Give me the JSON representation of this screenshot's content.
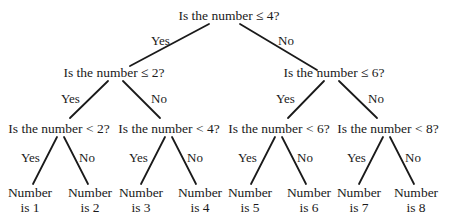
{
  "diagram": {
    "type": "binary-decision-tree",
    "line_color": "#1a1a1a",
    "root": {
      "question": "Is the number ≤ 4?",
      "yes": {
        "question": "Is the number ≤ 2?",
        "yes": {
          "question": "Is the number < 2?",
          "yes": {
            "line1": "Number",
            "line2": "is 1"
          },
          "no": {
            "line1": "Number",
            "line2": "is 2"
          }
        },
        "no": {
          "question": "Is the number < 4?",
          "yes": {
            "line1": "Number",
            "line2": "is 3"
          },
          "no": {
            "line1": "Number",
            "line2": "is 4"
          }
        }
      },
      "no": {
        "question": "Is the number ≤ 6?",
        "yes": {
          "question": "Is the number < 6?",
          "yes": {
            "line1": "Number",
            "line2": "is 5"
          },
          "no": {
            "line1": "Number",
            "line2": "is 6"
          }
        },
        "no": {
          "question": "Is the number < 8?",
          "yes": {
            "line1": "Number",
            "line2": "is 7"
          },
          "no": {
            "line1": "Number",
            "line2": "is 8"
          }
        }
      }
    },
    "edge_labels": {
      "yes": "Yes",
      "no": "No"
    }
  }
}
